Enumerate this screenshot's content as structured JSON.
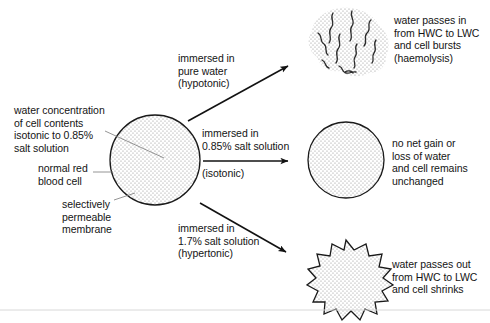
{
  "diagram": {
    "background_color": "#ffffff",
    "text_color": "#141414",
    "stipple_color": "#8a8a8a"
  },
  "source_cell": {
    "shape": "circle",
    "annotations": {
      "water_concentration": "water concentration\nof cell contents\nisotonic to 0.85%\nsalt solution",
      "cell_name": "normal red\nblood cell",
      "membrane": "selectively\npermeable\nmembrane"
    }
  },
  "branches": [
    {
      "id": "hypotonic",
      "condition_label": "immersed in\npure water\n(hypotonic)",
      "arrow_direction": "up-right",
      "result_shape": "burst-cell",
      "result_text": "water passes in\nfrom HWC to LWC\nand cell bursts\n(haemolysis)"
    },
    {
      "id": "isotonic",
      "condition_label": "immersed in\n0.85% salt solution",
      "condition_sublabel": "(isotonic)",
      "arrow_direction": "right",
      "result_shape": "circle",
      "result_text": "no net gain or\nloss of water\nand cell remains\nunchanged"
    },
    {
      "id": "hypertonic",
      "condition_label": "immersed in\n1.7% salt solution\n(hypertonic)",
      "arrow_direction": "down-right",
      "result_shape": "crenated-cell",
      "result_text": "water passes out\nfrom HWC to LWC\nand cell shrinks"
    }
  ]
}
